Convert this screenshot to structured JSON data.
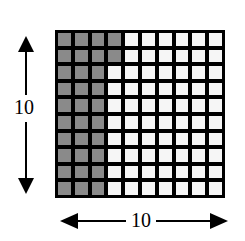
{
  "diagram": {
    "type": "hundred-grid",
    "rows": 10,
    "columns": 10,
    "shaded_count": 32,
    "shaded_full_columns": 3,
    "shaded_partial_column": {
      "column": 4,
      "rows": 2
    },
    "height_label": "10",
    "width_label": "10",
    "colors": {
      "shaded": "#8a8a8a",
      "unshaded": "#f6f6f6",
      "grid_lines": "#000000"
    }
  }
}
